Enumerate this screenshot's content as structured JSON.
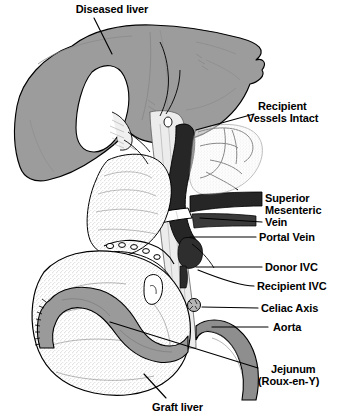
{
  "figure": {
    "kind": "anatomical-illustration",
    "background_color": "#ffffff",
    "palette": {
      "outline": "#000000",
      "diseased_liver_fill": "#9c9c9c",
      "graft_liver_fill": "#f2f2f2",
      "jejunum_fill": "#9a9a9a",
      "vein_dark_fill": "#262626",
      "aorta_fill": "#8e8e8e",
      "white_fill": "#ffffff",
      "stipple": "#6e6e6e",
      "leader_line": "#000000"
    }
  },
  "labels": {
    "diseased_liver": "Diseased liver",
    "recipient_vessels_intact_line1": "Recipient",
    "recipient_vessels_intact_line2": "Vessels Intact",
    "superior": "Superior",
    "mesenteric": "Mesenteric",
    "vein": "Vein",
    "portal_vein": "Portal Vein",
    "donor_ivc": "Donor IVC",
    "recipient_ivc": "Recipient IVC",
    "celiac_axis": "Celiac Axis",
    "aorta": "Aorta",
    "jejunum": "Jejunum",
    "roux_en_y": "(Roux-en-Y)",
    "graft_liver": "Graft liver"
  },
  "label_list": [
    {
      "id": "diseased-liver",
      "text": "Diseased liver",
      "x": 60,
      "y": 4
    },
    {
      "id": "recipient-vessels-intact",
      "text": "Recipient Vessels Intact",
      "x": 258,
      "y": 104
    },
    {
      "id": "superior-mesenteric-vein",
      "text": "Superior Mesenteric Vein",
      "x": 264,
      "y": 192
    },
    {
      "id": "portal-vein",
      "text": "Portal Vein",
      "x": 258,
      "y": 232
    },
    {
      "id": "donor-ivc",
      "text": "Donor IVC",
      "x": 264,
      "y": 262
    },
    {
      "id": "recipient-ivc",
      "text": "Recipient IVC",
      "x": 256,
      "y": 281
    },
    {
      "id": "celiac-axis",
      "text": "Celiac Axis",
      "x": 260,
      "y": 303
    },
    {
      "id": "aorta",
      "text": "Aorta",
      "x": 272,
      "y": 322
    },
    {
      "id": "jejunum-roux-en-y",
      "text": "Jejunum (Roux-en-Y)",
      "x": 262,
      "y": 364
    },
    {
      "id": "graft-liver",
      "text": "Graft liver",
      "x": 152,
      "y": 402
    }
  ]
}
